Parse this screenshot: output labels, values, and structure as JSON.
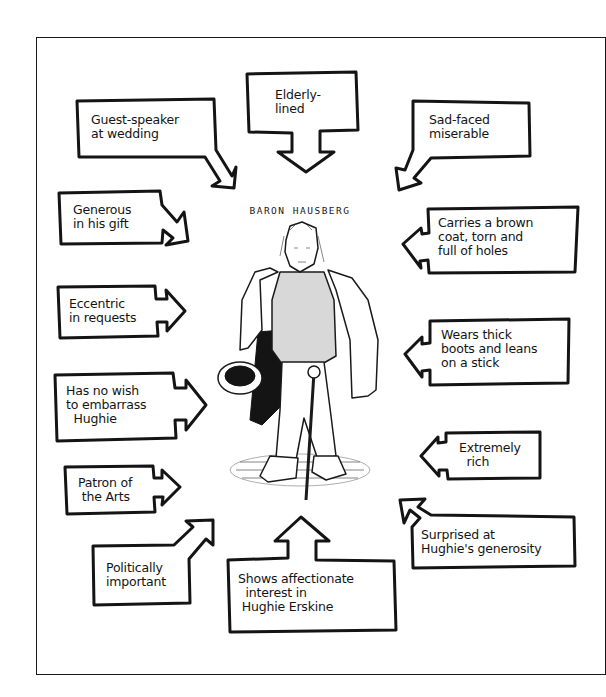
{
  "title": "BARON HAUSBERG",
  "colors": {
    "ink": "#141414",
    "paper": "#ffffff"
  },
  "character": {
    "name": "Baron Hausberg",
    "depiction": "elderly man in torn coat holding a hat and leaning on a stick"
  },
  "traits": [
    {
      "id": "guest-speaker",
      "text": "Guest-speaker\nat wedding",
      "arrow": "down-right"
    },
    {
      "id": "elderly",
      "text": "Elderly-\nlined",
      "arrow": "down"
    },
    {
      "id": "sad-faced",
      "text": "Sad-faced\nmiserable",
      "arrow": "down-left"
    },
    {
      "id": "generous",
      "text": "Generous\nin his gift",
      "arrow": "right"
    },
    {
      "id": "carries-coat",
      "text": "Carries a brown\ncoat, torn and\nfull of holes",
      "arrow": "left"
    },
    {
      "id": "eccentric",
      "text": "Eccentric\nin requests",
      "arrow": "right"
    },
    {
      "id": "wears-boots",
      "text": "Wears thick\nboots and leans\non a stick",
      "arrow": "left"
    },
    {
      "id": "no-wish",
      "text": "Has no wish\nto embarrass\n  Hughie",
      "arrow": "right"
    },
    {
      "id": "extremely-rich",
      "text": "Extremely\n  rich",
      "arrow": "left"
    },
    {
      "id": "patron",
      "text": "Patron of\n the Arts",
      "arrow": "right"
    },
    {
      "id": "surprised",
      "text": "Surprised at\nHughie's generosity",
      "arrow": "up-left"
    },
    {
      "id": "politically",
      "text": "Politically\nimportant",
      "arrow": "up-right"
    },
    {
      "id": "shows-affection",
      "text": "Shows affectionate\n  interest in\n Hughie Erskine",
      "arrow": "up"
    }
  ]
}
